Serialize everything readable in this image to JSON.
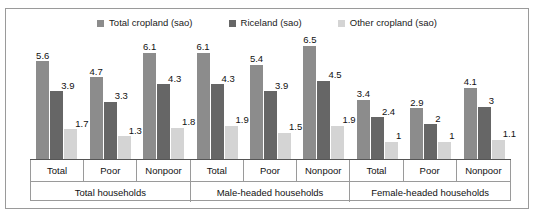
{
  "chart_data": {
    "type": "bar",
    "title": "",
    "subtitle": "",
    "xlabel": "",
    "ylabel": "",
    "ylim": [
      0,
      7
    ],
    "grid": false,
    "legend_position": "top-center",
    "legend": [
      {
        "name": "Total cropland (sao)",
        "color": "#8c8c8c",
        "swatch_name": "legend-swatch-total-cropland"
      },
      {
        "name": "Riceland (sao)",
        "color": "#666666",
        "swatch_name": "legend-swatch-riceland"
      },
      {
        "name": "Other cropland (sao)",
        "color": "#d4d4d4",
        "swatch_name": "legend-swatch-other-cropland"
      }
    ],
    "series": [
      {
        "name": "Total cropland (sao)",
        "color": "#8c8c8c",
        "values": [
          5.6,
          4.7,
          6.1,
          6.1,
          5.4,
          6.5,
          3.4,
          2.9,
          4.1
        ]
      },
      {
        "name": "Riceland (sao)",
        "color": "#666666",
        "values": [
          3.9,
          3.3,
          4.3,
          4.3,
          3.9,
          4.5,
          2.4,
          2,
          3
        ]
      },
      {
        "name": "Other cropland (sao)",
        "color": "#d4d4d4",
        "values": [
          1.7,
          1.3,
          1.8,
          1.9,
          1.5,
          1.9,
          1,
          1,
          1.1
        ]
      }
    ],
    "categories": [
      "Total",
      "Poor",
      "Nonpoor",
      "Total",
      "Poor",
      "Nonpoor",
      "Total",
      "Poor",
      "Nonpoor"
    ],
    "value_labels": [
      [
        "5.6",
        "3.9",
        "1.7"
      ],
      [
        "4.7",
        "3.3",
        "1.3"
      ],
      [
        "6.1",
        "4.3",
        "1.8"
      ],
      [
        "6.1",
        "4.3",
        "1.9"
      ],
      [
        "5.4",
        "3.9",
        "1.5"
      ],
      [
        "6.5",
        "4.5",
        "1.9"
      ],
      [
        "3.4",
        "2.4",
        "1"
      ],
      [
        "2.9",
        "2",
        "1"
      ],
      [
        "4.1",
        "3",
        "1.1"
      ]
    ],
    "groups": [
      {
        "label": "Total households",
        "categories": [
          "Total",
          "Poor",
          "Nonpoor"
        ]
      },
      {
        "label": "Male-headed households",
        "categories": [
          "Total",
          "Poor",
          "Nonpoor"
        ]
      },
      {
        "label": "Female-headed households",
        "categories": [
          "Total",
          "Poor",
          "Nonpoor"
        ]
      }
    ]
  }
}
